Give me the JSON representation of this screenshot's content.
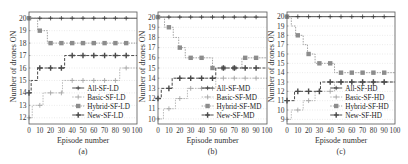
{
  "chart_data": [
    {
      "type": "line",
      "panel": "(a)",
      "xlabel": "Episode number",
      "ylabel": "Number of drones ON",
      "xlim": [
        0,
        100
      ],
      "ylim": [
        11.5,
        20.5
      ],
      "xticks": [
        0,
        10,
        20,
        30,
        40,
        50,
        60,
        70,
        80,
        90,
        100
      ],
      "yticks": [
        12,
        13,
        14,
        15,
        16,
        17,
        18,
        19,
        20
      ],
      "grid": "horizontal dotted",
      "legend_position": "lower right",
      "series": [
        {
          "name": "All-SF-LD",
          "marker": "plus-dark",
          "steps": [
            [
              0,
              20
            ],
            [
              100,
              20
            ]
          ]
        },
        {
          "name": "Basic-SF-LD",
          "marker": "plus-light",
          "steps": [
            [
              0,
              12
            ],
            [
              3,
              13
            ],
            [
              13,
              14
            ],
            [
              31,
              15
            ],
            [
              84,
              16
            ],
            [
              100,
              16
            ]
          ]
        },
        {
          "name": "Hybrid-SF-LD",
          "marker": "square",
          "steps": [
            [
              0,
              20
            ],
            [
              8,
              19
            ],
            [
              17,
              18
            ],
            [
              100,
              18
            ]
          ]
        },
        {
          "name": "New-SF-LD",
          "marker": "plus-bold",
          "steps": [
            [
              0,
              14
            ],
            [
              2,
              15
            ],
            [
              8,
              16
            ],
            [
              33,
              17
            ],
            [
              100,
              17
            ]
          ]
        }
      ]
    },
    {
      "type": "line",
      "panel": "(b)",
      "xlabel": "Episode number",
      "ylabel": "Number of drones ON",
      "xlim": [
        0,
        100
      ],
      "ylim": [
        9.5,
        20.5
      ],
      "xticks": [
        0,
        10,
        20,
        30,
        40,
        50,
        60,
        70,
        80,
        90,
        100
      ],
      "yticks": [
        10,
        11,
        12,
        13,
        14,
        15,
        16,
        17,
        18,
        19,
        20
      ],
      "grid": "horizontal dotted",
      "legend_position": "lower right",
      "series": [
        {
          "name": "All-SF-MD",
          "marker": "plus-dark",
          "steps": [
            [
              0,
              20
            ],
            [
              100,
              20
            ]
          ]
        },
        {
          "name": "Basic-SF-MD",
          "marker": "plus-light",
          "steps": [
            [
              0,
              10
            ],
            [
              5,
              11
            ],
            [
              16,
              12
            ],
            [
              27,
              13
            ],
            [
              53,
              14
            ],
            [
              100,
              14
            ]
          ]
        },
        {
          "name": "Hybrid-SF-MD",
          "marker": "square",
          "steps": [
            [
              0,
              20
            ],
            [
              6,
              19
            ],
            [
              14,
              18
            ],
            [
              19,
              17
            ],
            [
              25,
              16
            ],
            [
              50,
              15
            ],
            [
              77,
              16
            ],
            [
              100,
              16
            ]
          ]
        },
        {
          "name": "New-SF-MD",
          "marker": "plus-bold",
          "steps": [
            [
              0,
              12
            ],
            [
              3,
              13
            ],
            [
              13,
              14
            ],
            [
              53,
              15
            ],
            [
              100,
              15
            ]
          ]
        }
      ]
    },
    {
      "type": "line",
      "panel": "(c)",
      "xlabel": "Episode number",
      "ylabel": "Number of drones ON",
      "xlim": [
        0,
        100
      ],
      "ylim": [
        8.5,
        20.5
      ],
      "xticks": [
        0,
        10,
        20,
        30,
        40,
        50,
        60,
        70,
        80,
        90,
        100
      ],
      "yticks": [
        9,
        10,
        11,
        12,
        13,
        14,
        15,
        16,
        17,
        18,
        19,
        20
      ],
      "grid": "horizontal dotted",
      "legend_position": "lower right",
      "series": [
        {
          "name": "All-SF-HD",
          "marker": "plus-dark",
          "steps": [
            [
              0,
              20
            ],
            [
              100,
              20
            ]
          ]
        },
        {
          "name": "Basic-SF-HD",
          "marker": "plus-light",
          "steps": [
            [
              0,
              9
            ],
            [
              4,
              10
            ],
            [
              15,
              11
            ],
            [
              26,
              12
            ],
            [
              44,
              13
            ],
            [
              100,
              13
            ]
          ]
        },
        {
          "name": "Hybrid-SF-HD",
          "marker": "square",
          "steps": [
            [
              0,
              20
            ],
            [
              4,
              19
            ],
            [
              8,
              18
            ],
            [
              15,
              17
            ],
            [
              19,
              16
            ],
            [
              26,
              15
            ],
            [
              44,
              14
            ],
            [
              100,
              14
            ]
          ]
        },
        {
          "name": "New-SF-HD",
          "marker": "plus-bold",
          "steps": [
            [
              0,
              11
            ],
            [
              7,
              12
            ],
            [
              31,
              13
            ],
            [
              100,
              13
            ]
          ]
        }
      ]
    }
  ],
  "panels": [
    {
      "caption": "(a)",
      "xlabel": "Episode number",
      "ylabel": "Number of drones ON",
      "legend": [
        "All-SF-LD",
        "Basic-SF-LD",
        "Hybrid-SF-LD",
        "New-SF-LD"
      ]
    },
    {
      "caption": "(b)",
      "xlabel": "Episode number",
      "ylabel": "Number of drones ON",
      "legend": [
        "All-SF-MD",
        "Basic-SF-MD",
        "Hybrid-SF-MD",
        "New-SF-MD"
      ]
    },
    {
      "caption": "(c)",
      "xlabel": "Episode number",
      "ylabel": "Number of drones ON",
      "legend": [
        "All-SF-HD",
        "Basic-SF-HD",
        "Hybrid-SF-HD",
        "New-SF-HD"
      ]
    }
  ],
  "colors": {
    "all": "#3a3a3a",
    "basic": "#a8a8a8",
    "hybrid": "#8c8c8c",
    "new": "#4a4a4a",
    "axis": "#555555",
    "grid": "#d6d6d6"
  }
}
